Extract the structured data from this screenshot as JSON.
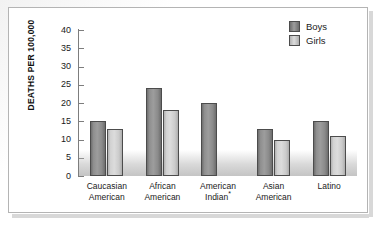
{
  "chart_data": {
    "type": "bar",
    "title": "",
    "subtitle": "",
    "xlabel": "",
    "ylabel": "DEATHS PER 100,000",
    "ylim": [
      0,
      40
    ],
    "ytick_step": 5,
    "yticks": [
      0,
      5,
      10,
      15,
      20,
      25,
      30,
      35,
      40
    ],
    "ytick_labels": [
      "0",
      "5",
      "10",
      "15",
      "20",
      "25",
      "30",
      "35",
      "40"
    ],
    "grid": false,
    "legend_position": "top-right",
    "categories": [
      "Caucasian American",
      "African American",
      "American Indian*",
      "Asian American",
      "Latino"
    ],
    "category_lines": [
      [
        "Caucasian",
        "American"
      ],
      [
        "African",
        "American"
      ],
      [
        "American",
        "Indian*"
      ],
      [
        "Asian",
        "American"
      ],
      [
        "Latino",
        ""
      ]
    ],
    "series": [
      {
        "name": "Boys",
        "color": "#8f8f8f",
        "values": [
          15,
          24,
          20,
          13,
          15
        ]
      },
      {
        "name": "Girls",
        "color": "#d2d2d2",
        "values": [
          13,
          18,
          null,
          10,
          11
        ]
      }
    ],
    "annotations": [
      "*"
    ]
  },
  "legend": {
    "items": [
      {
        "label": "Boys",
        "swatch": "boys-swatch"
      },
      {
        "label": "Girls",
        "swatch": "girls-swatch"
      }
    ]
  },
  "axis": {
    "y_title": "DEATHS PER 100,000"
  }
}
